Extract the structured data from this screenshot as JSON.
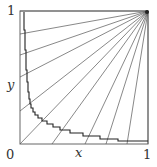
{
  "diagram": {
    "labels": {
      "y_top": "1",
      "y_axis": "y",
      "origin": "0",
      "x_axis": "x",
      "x_right": "1"
    },
    "box": {
      "x0": 0,
      "y0": 0,
      "x1": 1,
      "y1": 1
    },
    "ray_origin": [
      1,
      1
    ],
    "ray_left_intercepts_y": [
      0.84,
      0.68,
      0.51,
      0.25,
      0.0
    ],
    "ray_bottom_intercepts_x": [
      0.25,
      0.5,
      0.67,
      0.83
    ],
    "colors": {
      "lines": "#555555",
      "curve": "#222222",
      "text": "#333333"
    }
  }
}
